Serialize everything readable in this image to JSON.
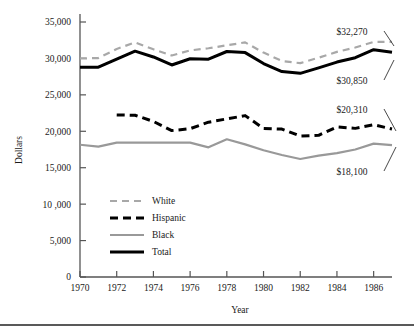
{
  "chart_data": {
    "type": "line",
    "title": "",
    "subtitle": "",
    "xlabel": "Year",
    "ylabel": "Dollars",
    "xlim": [
      1970,
      1987
    ],
    "ylim": [
      0,
      35000
    ],
    "grid": false,
    "legend_position": "inside-lower-left",
    "x_tick_labels": [
      "1970",
      "1972",
      "1974",
      "1976",
      "1978",
      "1980",
      "1982",
      "1984",
      "1986"
    ],
    "x_ticks": [
      1970,
      1972,
      1974,
      1976,
      1978,
      1980,
      1982,
      1984,
      1986
    ],
    "y_tick_labels": [
      "0",
      "5,000",
      "10 ,000",
      "15,000",
      "20,000",
      "25,000",
      "30,000",
      "35,000"
    ],
    "y_ticks": [
      0,
      5000,
      10000,
      15000,
      20000,
      25000,
      30000,
      35000
    ],
    "x": [
      1970,
      1971,
      1972,
      1973,
      1974,
      1975,
      1976,
      1977,
      1978,
      1979,
      1980,
      1981,
      1982,
      1983,
      1984,
      1985,
      1986,
      1987
    ],
    "series": [
      {
        "name": "White",
        "style": "dashed",
        "color": "#a8a8a8",
        "width": 2.2,
        "x": [
          1970,
          1971,
          1972,
          1973,
          1974,
          1975,
          1976,
          1977,
          1978,
          1979,
          1980,
          1981,
          1982,
          1983,
          1984,
          1985,
          1986,
          1987
        ],
        "values": [
          30000,
          30050,
          31300,
          32200,
          31250,
          30400,
          31100,
          31400,
          31800,
          32200,
          30800,
          29650,
          29350,
          30100,
          30900,
          31500,
          32270,
          32270
        ]
      },
      {
        "name": "Hispanic",
        "style": "dashed-bold",
        "color": "#000000",
        "width": 3.0,
        "x": [
          1972,
          1973,
          1974,
          1975,
          1976,
          1977,
          1978,
          1979,
          1980,
          1981,
          1982,
          1983,
          1984,
          1985,
          1986,
          1987
        ],
        "values": [
          22250,
          22200,
          21350,
          20100,
          20350,
          21250,
          21700,
          22150,
          20400,
          20300,
          19350,
          19450,
          20600,
          20400,
          20900,
          20310
        ]
      },
      {
        "name": "Black",
        "style": "solid",
        "color": "#999999",
        "width": 2.2,
        "x": [
          1970,
          1971,
          1972,
          1973,
          1974,
          1975,
          1976,
          1977,
          1978,
          1979,
          1980,
          1981,
          1982,
          1983,
          1984,
          1985,
          1986,
          1987
        ],
        "values": [
          18150,
          17900,
          18450,
          18450,
          18450,
          18450,
          18450,
          17800,
          18900,
          18200,
          17400,
          16750,
          16200,
          16650,
          17000,
          17500,
          18300,
          18100
        ]
      },
      {
        "name": "Total",
        "style": "solid-bold",
        "color": "#000000",
        "width": 3.0,
        "x": [
          1970,
          1971,
          1972,
          1973,
          1974,
          1975,
          1976,
          1977,
          1978,
          1979,
          1980,
          1981,
          1982,
          1983,
          1984,
          1985,
          1986,
          1987
        ],
        "values": [
          28800,
          28800,
          29900,
          31000,
          30200,
          29100,
          29950,
          29900,
          30950,
          30800,
          29300,
          28200,
          27950,
          28700,
          29500,
          30100,
          31200,
          30850
        ]
      }
    ],
    "annotations": [
      {
        "label": "$32,270",
        "series": "White",
        "value": 32270
      },
      {
        "label": "$30,850",
        "series": "Total",
        "value": 30850
      },
      {
        "label": "$20,310",
        "series": "Hispanic",
        "value": 20310
      },
      {
        "label": "$18,100",
        "series": "Black",
        "value": 18100
      }
    ]
  },
  "legend": {
    "items": [
      {
        "label": "White"
      },
      {
        "label": "Hispanic"
      },
      {
        "label": "Black"
      },
      {
        "label": "Total"
      }
    ]
  }
}
